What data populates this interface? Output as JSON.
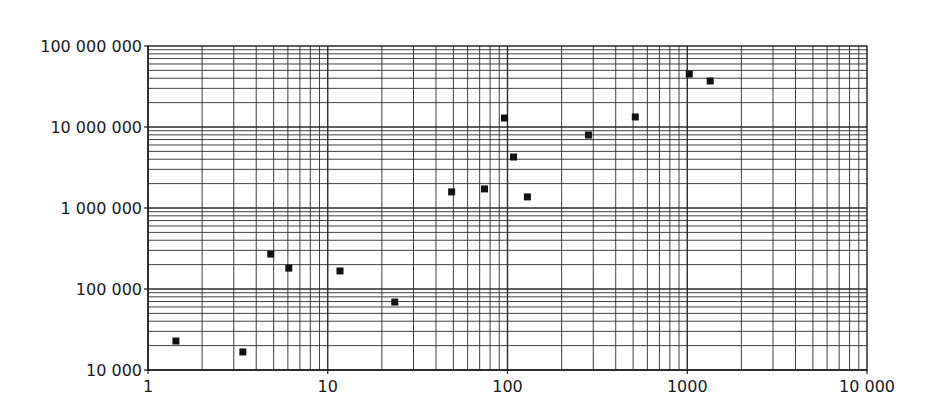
{
  "chart_data": {
    "type": "scatter",
    "title": "",
    "xlabel": "",
    "ylabel": "",
    "xscale": "log",
    "yscale": "log",
    "xlim": [
      1,
      10000
    ],
    "ylim": [
      10000,
      100000000
    ],
    "grid": true,
    "grid_minor": true,
    "legend": null,
    "x_ticks": [
      1,
      10,
      100,
      1000,
      10000
    ],
    "x_tick_labels": [
      "1",
      "10",
      "100",
      "1000",
      "10 000"
    ],
    "y_ticks": [
      10000,
      100000,
      1000000,
      10000000,
      100000000
    ],
    "y_tick_labels": [
      "10 000",
      "100 000",
      "1 000 000",
      "10 000 000",
      "100 000 000"
    ],
    "marker": "square",
    "marker_color": "#111111",
    "series": [
      {
        "name": "data",
        "points": [
          {
            "x": 1.43,
            "y": 22800
          },
          {
            "x": 3.37,
            "y": 16700
          },
          {
            "x": 4.82,
            "y": 270000
          },
          {
            "x": 6.07,
            "y": 181000
          },
          {
            "x": 11.7,
            "y": 167000
          },
          {
            "x": 23.6,
            "y": 69000
          },
          {
            "x": 48.9,
            "y": 1580000
          },
          {
            "x": 74.5,
            "y": 1720000
          },
          {
            "x": 96.2,
            "y": 12900000
          },
          {
            "x": 108,
            "y": 4260000
          },
          {
            "x": 129,
            "y": 1370000
          },
          {
            "x": 282,
            "y": 7960000
          },
          {
            "x": 514,
            "y": 13300000
          },
          {
            "x": 1026,
            "y": 45100000
          },
          {
            "x": 1342,
            "y": 37000000
          }
        ]
      }
    ]
  },
  "layout": {
    "plot_left": 148,
    "plot_right": 867,
    "plot_top": 46,
    "plot_bottom": 370,
    "grid_color": "#2a2a2a",
    "axis_color": "#1a1a1a"
  }
}
